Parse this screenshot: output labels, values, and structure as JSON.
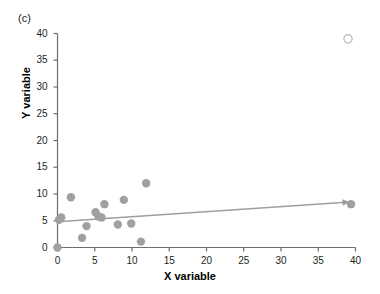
{
  "panel": {
    "label": "(c)"
  },
  "chart_data": {
    "type": "scatter",
    "title": "",
    "subtitle": "",
    "xlabel": "X variable",
    "ylabel": "Y variable",
    "xlim": [
      0,
      40
    ],
    "ylim": [
      0,
      40
    ],
    "xticks": [
      0,
      5,
      10,
      15,
      20,
      25,
      30,
      35,
      40
    ],
    "yticks": [
      0,
      5,
      10,
      15,
      20,
      25,
      30,
      35,
      40
    ],
    "xtick_labels": [
      "0",
      "5",
      "10",
      "15",
      "20",
      "25",
      "30",
      "35",
      "40"
    ],
    "ytick_labels": [
      "0",
      "5",
      "10",
      "15",
      "20",
      "25",
      "30",
      "35",
      "40"
    ],
    "grid": false,
    "legend": null,
    "series": [
      {
        "name": "data points",
        "marker": "filled-circle",
        "color": "#a0a0a0",
        "points": [
          {
            "x": 0.0,
            "y": 0.0
          },
          {
            "x": 0.2,
            "y": 5.2
          },
          {
            "x": 0.5,
            "y": 5.6
          },
          {
            "x": 1.8,
            "y": 9.4
          },
          {
            "x": 3.3,
            "y": 1.8
          },
          {
            "x": 3.9,
            "y": 4.0
          },
          {
            "x": 5.1,
            "y": 6.6
          },
          {
            "x": 5.5,
            "y": 5.8
          },
          {
            "x": 5.9,
            "y": 5.6
          },
          {
            "x": 6.3,
            "y": 8.1
          },
          {
            "x": 8.1,
            "y": 4.3
          },
          {
            "x": 8.9,
            "y": 8.9
          },
          {
            "x": 9.9,
            "y": 4.5
          },
          {
            "x": 11.2,
            "y": 1.1
          },
          {
            "x": 11.9,
            "y": 12.0
          },
          {
            "x": 39.4,
            "y": 8.1
          }
        ]
      },
      {
        "name": "outlier",
        "marker": "open-circle",
        "color": "#bdbdbd",
        "points": [
          {
            "x": 39.0,
            "y": 39.0
          }
        ]
      }
    ],
    "trendline": {
      "name": "regression-line",
      "color": "#9e9e9e",
      "arrow": true,
      "x_start": 0.0,
      "y_start": 4.8,
      "x_end": 39.2,
      "y_end": 8.5
    },
    "colors": {
      "marker_fill": "#a0a0a0",
      "outlier_stroke": "#c4c4c4",
      "trendline": "#9e9e9e",
      "axis": "#6d6d6d",
      "text": "#231f20",
      "background": "#ffffff"
    }
  }
}
